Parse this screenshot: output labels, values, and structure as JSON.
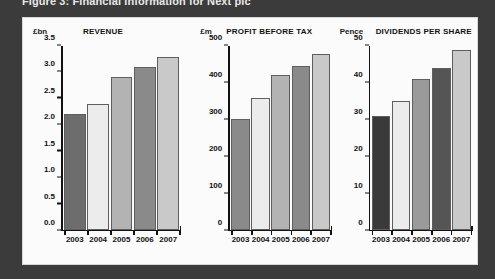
{
  "figure": {
    "caption": "Figure 3: Financial information for Next plc",
    "background_color": "#3b3b3b",
    "panel_color": "#fbfbfb"
  },
  "bar_palette": {
    "2003": "#6d6d6d",
    "2004": "#ececec",
    "2005": "#b3b3b3",
    "2006": "#8a8a8a",
    "2007": "#c9c9c9",
    "2003_dark": "#3a3a3a"
  },
  "chart_data": [
    {
      "id": "revenue",
      "type": "bar",
      "title": "REVENUE",
      "unit_label": "£bn",
      "xlabel": "",
      "ylabel": "£bn",
      "categories": [
        "2003",
        "2004",
        "2005",
        "2006",
        "2007"
      ],
      "values": [
        2.2,
        2.4,
        2.9,
        3.1,
        3.3
      ],
      "bar_colors": [
        "#6d6d6d",
        "#ececec",
        "#b3b3b3",
        "#8a8a8a",
        "#c9c9c9"
      ],
      "ylim": [
        0.0,
        3.5
      ],
      "yticks": [
        0.0,
        0.5,
        1.0,
        1.5,
        2.0,
        2.5,
        3.0,
        3.5
      ],
      "ytick_labels": [
        "0.0",
        "0.5",
        "1.0",
        "1.5",
        "2.0",
        "2.5",
        "3.0",
        "3.5"
      ],
      "grid": false,
      "legend": false
    },
    {
      "id": "profit-before-tax",
      "type": "bar",
      "title": "PROFIT BEFORE TAX",
      "unit_label": "£m",
      "xlabel": "",
      "ylabel": "£m",
      "categories": [
        "2003",
        "2004",
        "2005",
        "2006",
        "2007"
      ],
      "values": [
        300,
        357,
        420,
        445,
        477
      ],
      "bar_colors": [
        "#8a8a8a",
        "#ececec",
        "#b3b3b3",
        "#8a8a8a",
        "#c9c9c9"
      ],
      "ylim": [
        0,
        500
      ],
      "yticks": [
        0,
        100,
        200,
        300,
        400,
        500
      ],
      "ytick_labels": [
        "0",
        "100",
        "200",
        "300",
        "400",
        "500"
      ],
      "grid": false,
      "legend": false
    },
    {
      "id": "dividends-per-share",
      "type": "bar",
      "title": "DIVIDENDS PER SHARE",
      "unit_label": "Pence",
      "xlabel": "",
      "ylabel": "Pence",
      "categories": [
        "2003",
        "2004",
        "2005",
        "2006",
        "2007"
      ],
      "values": [
        31,
        35,
        41,
        44,
        49
      ],
      "bar_colors": [
        "#3a3a3a",
        "#ececec",
        "#9a9a9a",
        "#555555",
        "#c9c9c9"
      ],
      "ylim": [
        0,
        50
      ],
      "yticks": [
        0,
        10,
        20,
        30,
        40,
        50
      ],
      "ytick_labels": [
        "0",
        "10",
        "20",
        "30",
        "40",
        "50"
      ],
      "grid": false,
      "legend": false
    }
  ]
}
